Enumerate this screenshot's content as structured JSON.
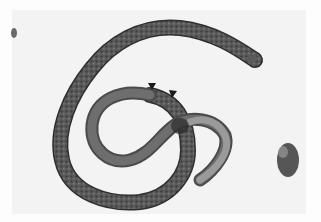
{
  "image": {
    "subject": "nematode larva micrograph",
    "description": "Light micrograph of a coiled nematode worm with two arrowheads marking a region of the body",
    "colors": {
      "background": "#f3f3f3",
      "body_dark": "#4a4a4a",
      "body_mid": "#6e6e6e",
      "tail_light": "#9a9a9a",
      "arrowhead": "#1a1a1a",
      "debris": "#2e2e2e"
    },
    "annotations": [
      {
        "type": "arrowhead",
        "x": 152,
        "y": 88
      },
      {
        "type": "arrowhead",
        "x": 173,
        "y": 95
      }
    ]
  }
}
